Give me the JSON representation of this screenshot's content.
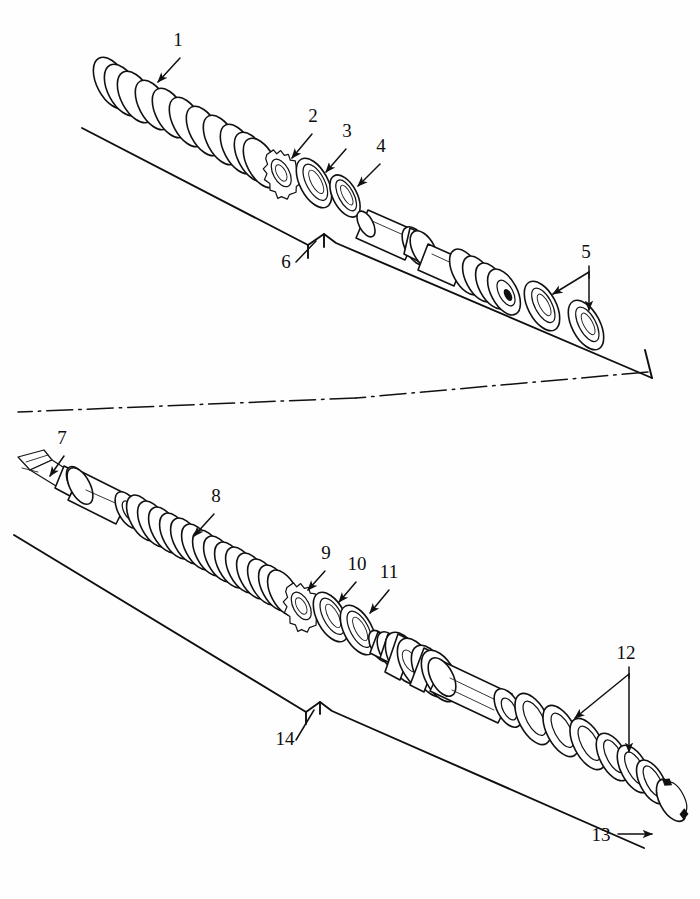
{
  "document": {
    "kind": "exploded-view-parts-diagram",
    "title": "",
    "background_color": "#fefefe",
    "line_color": "#111111",
    "width": 700,
    "height": 899
  },
  "assemblies": [
    {
      "id": "upper-assembly",
      "baseline_label": "6",
      "parts": [
        {
          "number": "1",
          "name": "compression-spring"
        },
        {
          "number": "2",
          "name": "tabbed-lock-washer"
        },
        {
          "number": "3",
          "name": "seal-ring-large"
        },
        {
          "number": "4",
          "name": "seal-ring-small"
        },
        {
          "number": "5",
          "name": "washer-pair"
        },
        {
          "number": "6",
          "name": "mounting-rail"
        }
      ]
    },
    {
      "id": "lower-assembly",
      "baseline_label": "14",
      "parts": [
        {
          "number": "7",
          "name": "shaft-end-stub"
        },
        {
          "number": "8",
          "name": "compression-spring-long"
        },
        {
          "number": "9",
          "name": "tabbed-lock-washer"
        },
        {
          "number": "10",
          "name": "seal-ring-large"
        },
        {
          "number": "11",
          "name": "seal-ring-small"
        },
        {
          "number": "12",
          "name": "washer-stack"
        },
        {
          "number": "13",
          "name": "retaining-snap-ring"
        },
        {
          "number": "14",
          "name": "mounting-rail"
        }
      ]
    }
  ],
  "callouts": [
    {
      "id": "c1",
      "text": "1",
      "x": 178,
      "y": 46
    },
    {
      "id": "c2",
      "text": "2",
      "x": 313,
      "y": 122
    },
    {
      "id": "c3",
      "text": "3",
      "x": 347,
      "y": 137
    },
    {
      "id": "c4",
      "text": "4",
      "x": 381,
      "y": 152
    },
    {
      "id": "c5",
      "text": "5",
      "x": 586,
      "y": 258
    },
    {
      "id": "c6",
      "text": "6",
      "x": 286,
      "y": 268
    },
    {
      "id": "c7",
      "text": "7",
      "x": 62,
      "y": 444
    },
    {
      "id": "c8",
      "text": "8",
      "x": 216,
      "y": 502
    },
    {
      "id": "c9",
      "text": "9",
      "x": 326,
      "y": 559
    },
    {
      "id": "c10",
      "text": "10",
      "x": 357,
      "y": 570
    },
    {
      "id": "c11",
      "text": "11",
      "x": 389,
      "y": 578
    },
    {
      "id": "c12",
      "text": "12",
      "x": 626,
      "y": 659
    },
    {
      "id": "c13",
      "text": "13",
      "x": 601,
      "y": 841
    },
    {
      "id": "c14",
      "text": "14",
      "x": 285,
      "y": 745
    }
  ]
}
